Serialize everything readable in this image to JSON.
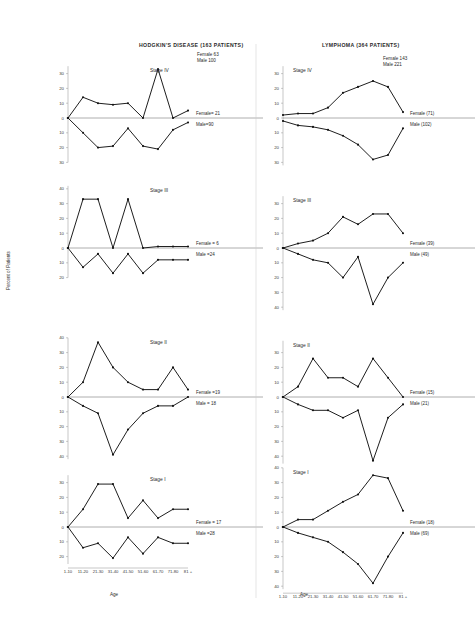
{
  "figure": {
    "ylabel": "Percent of Patients",
    "xlabel_left": "Age",
    "xlabel_right": "Age",
    "age_groups": [
      "1-10",
      "11-20",
      "21-30",
      "31-40",
      "41-50",
      "51-60",
      "61-70",
      "71-80",
      "81 +"
    ],
    "y_ticks": [
      30,
      20,
      10,
      0,
      10,
      20,
      30
    ],
    "y_ticks_extended": [
      40,
      30,
      20,
      10,
      0,
      10,
      20,
      30,
      40
    ],
    "line_color": "#121212",
    "axis_color": "#8d8d8d"
  },
  "panels": [
    {
      "id": "hodgkins",
      "title": "HODGKIN'S DISEASE (163 PATIENTS)",
      "legend": {
        "female": "Female  63",
        "male": "Male  100"
      }
    },
    {
      "id": "lymphoma",
      "title": "LYMPHOMA (364 PATIENTS)",
      "legend": {
        "female": "Female  143",
        "male": "Male    221"
      }
    }
  ],
  "chart_data": [
    {
      "type": "line",
      "panel": "hodgkins",
      "stage": "Stage IV",
      "title": "HODGKIN'S DISEASE (163 PATIENTS) - Stage IV",
      "xlabel": "Age",
      "ylabel": "Percent of Patients",
      "categories": [
        "1-10",
        "11-20",
        "21-30",
        "31-40",
        "41-50",
        "51-60",
        "61-70",
        "71-80",
        "81 +"
      ],
      "ylim": [
        -30,
        35
      ],
      "grid": false,
      "annotations": {
        "female_count": "Female= 21",
        "male_count": "Male=90"
      },
      "series": [
        {
          "name": "Female",
          "direction": "up",
          "values": [
            0,
            14,
            10,
            9,
            10,
            0,
            33,
            0,
            5
          ]
        },
        {
          "name": "Male",
          "direction": "down",
          "values": [
            0,
            10,
            20,
            19,
            7,
            19,
            21,
            8,
            3
          ]
        }
      ]
    },
    {
      "type": "line",
      "panel": "hodgkins",
      "stage": "Stage III",
      "xlabel": "Age",
      "ylabel": "Percent of Patients",
      "categories": [
        "1-10",
        "11-20",
        "21-30",
        "31-40",
        "41-50",
        "51-60",
        "61-70",
        "71-80",
        "81 +"
      ],
      "ylim": [
        -20,
        42
      ],
      "grid": false,
      "annotations": {
        "female_count": "Female = 6",
        "male_count": "Male =24"
      },
      "series": [
        {
          "name": "Female",
          "direction": "up",
          "values": [
            0,
            33,
            33,
            0,
            33,
            0,
            1,
            1,
            1
          ]
        },
        {
          "name": "Male",
          "direction": "down",
          "values": [
            0,
            13,
            4,
            17,
            4,
            17,
            8,
            8,
            8
          ]
        }
      ]
    },
    {
      "type": "line",
      "panel": "hodgkins",
      "stage": "Stage II",
      "xlabel": "Age",
      "ylabel": "Percent of Patients",
      "categories": [
        "1-10",
        "11-20",
        "21-30",
        "31-40",
        "41-50",
        "51-60",
        "61-70",
        "71-80",
        "81 +"
      ],
      "ylim": [
        -42,
        40
      ],
      "grid": false,
      "annotations": {
        "female_count": "Female =19",
        "male_count": "Male = 18"
      },
      "series": [
        {
          "name": "Female",
          "direction": "up",
          "values": [
            0,
            10,
            37,
            20,
            10,
            5,
            5,
            20,
            5
          ]
        },
        {
          "name": "Male",
          "direction": "down",
          "values": [
            0,
            6,
            11,
            39,
            22,
            11,
            6,
            6,
            0
          ]
        }
      ]
    },
    {
      "type": "line",
      "panel": "hodgkins",
      "stage": "Stage I",
      "xlabel": "Age",
      "ylabel": "Percent of Patients",
      "categories": [
        "1-10",
        "11-20",
        "21-30",
        "31-40",
        "41-50",
        "51-60",
        "61-70",
        "71-80",
        "81 +"
      ],
      "ylim": [
        -25,
        35
      ],
      "grid": false,
      "annotations": {
        "female_count": "Female = 17",
        "male_count": "Male =28"
      },
      "series": [
        {
          "name": "Female",
          "direction": "up",
          "values": [
            0,
            12,
            29,
            29,
            6,
            18,
            6,
            12,
            12
          ]
        },
        {
          "name": "Male",
          "direction": "down",
          "values": [
            0,
            14,
            11,
            21,
            7,
            18,
            7,
            11,
            11
          ]
        }
      ]
    },
    {
      "type": "line",
      "panel": "lymphoma",
      "stage": "Stage IV",
      "title": "LYMPHOMA (364 PATIENTS) - Stage IV",
      "xlabel": "Age",
      "ylabel": "Percent of Patients",
      "categories": [
        "1-10",
        "11-20",
        "21-30",
        "31-40",
        "41-50",
        "51-60",
        "61-70",
        "71-80",
        "81 +"
      ],
      "ylim": [
        -32,
        35
      ],
      "grid": false,
      "annotations": {
        "female_count": "Female (71)",
        "male_count": "Male (102)"
      },
      "series": [
        {
          "name": "Female",
          "direction": "up",
          "values": [
            2,
            3,
            3,
            7,
            17,
            21,
            25,
            21,
            4
          ]
        },
        {
          "name": "Male",
          "direction": "down",
          "values": [
            2,
            5,
            6,
            8,
            12,
            18,
            28,
            25,
            7
          ]
        }
      ]
    },
    {
      "type": "line",
      "panel": "lymphoma",
      "stage": "Stage III",
      "xlabel": "Age",
      "ylabel": "Percent of Patients",
      "categories": [
        "1-10",
        "11-20",
        "21-30",
        "31-40",
        "41-50",
        "51-60",
        "61-70",
        "71-80",
        "81 +"
      ],
      "ylim": [
        -42,
        35
      ],
      "grid": false,
      "annotations": {
        "female_count": "Female (39)",
        "male_count": "Male (49)"
      },
      "series": [
        {
          "name": "Female",
          "direction": "up",
          "values": [
            0,
            3,
            5,
            10,
            21,
            16,
            23,
            23,
            10
          ]
        },
        {
          "name": "Male",
          "direction": "down",
          "values": [
            0,
            4,
            8,
            10,
            20,
            6,
            38,
            20,
            10
          ]
        }
      ]
    },
    {
      "type": "line",
      "panel": "lymphoma",
      "stage": "Stage II",
      "xlabel": "Age",
      "ylabel": "Percent of Patients",
      "categories": [
        "1-10",
        "11-20",
        "21-30",
        "31-40",
        "41-50",
        "51-60",
        "61-70",
        "71-80",
        "81 +"
      ],
      "ylim": [
        -45,
        38
      ],
      "grid": false,
      "annotations": {
        "female_count": "Female (15)",
        "male_count": "Male (21)"
      },
      "series": [
        {
          "name": "Female",
          "direction": "up",
          "values": [
            0,
            7,
            26,
            13,
            13,
            7,
            26,
            13,
            0
          ]
        },
        {
          "name": "Male",
          "direction": "down",
          "values": [
            0,
            5,
            9,
            9,
            14,
            9,
            43,
            14,
            5
          ]
        }
      ]
    },
    {
      "type": "line",
      "panel": "lymphoma",
      "stage": "Stage I",
      "xlabel": "Age",
      "ylabel": "Percent of Patients",
      "categories": [
        "1-10",
        "11-20",
        "21-30",
        "31-40",
        "41-50",
        "51-60",
        "61-70",
        "71-80",
        "81 +"
      ],
      "ylim": [
        -42,
        40
      ],
      "grid": false,
      "annotations": {
        "female_count": "Female (18)",
        "male_count": "Male (69)"
      },
      "series": [
        {
          "name": "Female",
          "direction": "up",
          "values": [
            0,
            5,
            5,
            11,
            17,
            22,
            35,
            33,
            11
          ]
        },
        {
          "name": "Male",
          "direction": "down",
          "values": [
            0,
            4,
            7,
            10,
            17,
            25,
            38,
            20,
            4
          ]
        }
      ]
    }
  ]
}
